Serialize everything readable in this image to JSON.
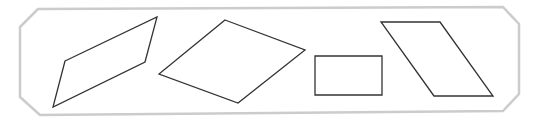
{
  "diagram": {
    "title": "",
    "frame": {
      "shape": "chamfered-rectangle",
      "stroke": "#cccccc",
      "stroke_width": 2.5,
      "points": [
        [
          38,
          9
        ],
        [
          503,
          7
        ],
        [
          519,
          24
        ],
        [
          519,
          94
        ],
        [
          503,
          111
        ],
        [
          40,
          115
        ],
        [
          20,
          97
        ],
        [
          20,
          27
        ]
      ]
    },
    "shapes": [
      {
        "id": "parallelogram-1",
        "type": "parallelogram",
        "stroke": "#333333",
        "stroke_width": 1.3,
        "points": [
          [
            65,
            61
          ],
          [
            157,
            17
          ],
          [
            145,
            62
          ],
          [
            53,
            107
          ]
        ]
      },
      {
        "id": "rhombus",
        "type": "rhombus",
        "stroke": "#333333",
        "stroke_width": 1.3,
        "points": [
          [
            225,
            20
          ],
          [
            305,
            50
          ],
          [
            238,
            103
          ],
          [
            159,
            74
          ]
        ]
      },
      {
        "id": "rectangle",
        "type": "rectangle",
        "stroke": "#333333",
        "stroke_width": 1.3,
        "points": [
          [
            315,
            56
          ],
          [
            382,
            56
          ],
          [
            382,
            95
          ],
          [
            315,
            95
          ]
        ]
      },
      {
        "id": "parallelogram-2",
        "type": "parallelogram",
        "stroke": "#333333",
        "stroke_width": 1.3,
        "points": [
          [
            381,
            22
          ],
          [
            440,
            22
          ],
          [
            493,
            96
          ],
          [
            434,
            96
          ]
        ]
      }
    ]
  }
}
